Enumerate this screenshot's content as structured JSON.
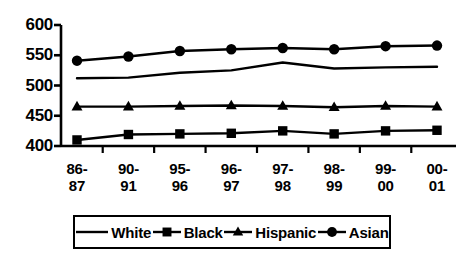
{
  "chart_data": {
    "type": "line",
    "title": "",
    "xlabel": "",
    "ylabel": "",
    "categories": [
      "86-87",
      "90-91",
      "95-96",
      "96-97",
      "97-98",
      "98-99",
      "99-00",
      "00-01"
    ],
    "ylim": [
      400,
      600
    ],
    "yticks": [
      400,
      450,
      500,
      550,
      600
    ],
    "grid": false,
    "legend_position": "bottom",
    "series": [
      {
        "name": "White",
        "marker": "none",
        "color": "#000000",
        "values": [
          512,
          513,
          521,
          525,
          538,
          528,
          530,
          531
        ]
      },
      {
        "name": "Black",
        "marker": "square",
        "color": "#000000",
        "values": [
          410,
          419,
          420,
          421,
          425,
          420,
          425,
          426
        ]
      },
      {
        "name": "Hispanic",
        "marker": "triangle",
        "color": "#000000",
        "values": [
          465,
          465,
          466,
          467,
          466,
          464,
          466,
          465
        ]
      },
      {
        "name": "Asian",
        "marker": "circle",
        "color": "#000000",
        "values": [
          541,
          548,
          557,
          560,
          562,
          560,
          565,
          566
        ]
      }
    ]
  },
  "axis": {
    "ytick_labels": [
      "600",
      "550",
      "500",
      "450",
      "400"
    ]
  },
  "xaxis": {
    "tick_labels": [
      {
        "top": "86-",
        "bottom": "87"
      },
      {
        "top": "90-",
        "bottom": "91"
      },
      {
        "top": "95-",
        "bottom": "96"
      },
      {
        "top": "96-",
        "bottom": "97"
      },
      {
        "top": "97-",
        "bottom": "98"
      },
      {
        "top": "98-",
        "bottom": "99"
      },
      {
        "top": "99-",
        "bottom": "00"
      },
      {
        "top": "00-",
        "bottom": "01"
      }
    ]
  },
  "legend": {
    "entries": [
      {
        "label": "White",
        "marker": "none"
      },
      {
        "label": "Black",
        "marker": "square"
      },
      {
        "label": "Hispanic",
        "marker": "triangle"
      },
      {
        "label": "Asian",
        "marker": "circle"
      }
    ]
  }
}
